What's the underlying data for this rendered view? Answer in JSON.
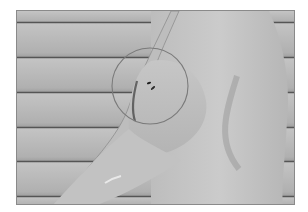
{
  "image": {
    "description": "Grayscale photograph of a person's upper arm and torso in profile against horizontal house siding, with a circular annotation marking a small dark lesion on the upper arm",
    "colors": {
      "background": "#ffffff",
      "siding": "#b8b8b8",
      "siding_shadow": "#5a5a5a",
      "skin_light": "#c9c9c9",
      "skin_shadow": "#9a9a9a",
      "annotation_circle": "#7a7a7a",
      "lesion": "#2a2a2a"
    },
    "annotation": {
      "shape": "circle",
      "center_x": 149,
      "center_y": 85,
      "radius": 38
    }
  }
}
